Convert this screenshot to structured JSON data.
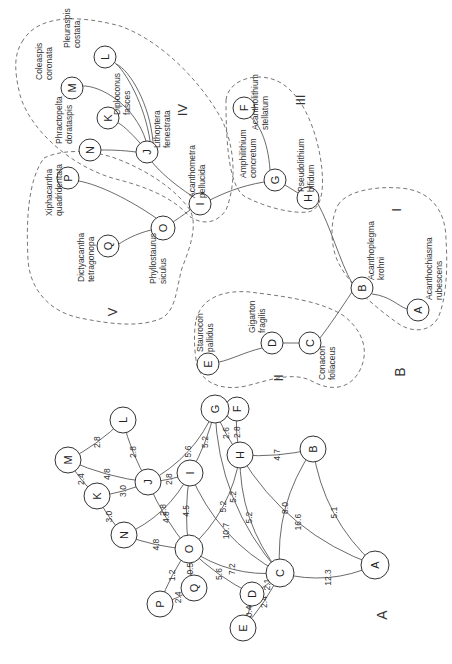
{
  "panels": {
    "a_label": "A",
    "b_label": "B"
  },
  "diagram_a": {
    "nodes": [
      {
        "id": "A",
        "x": 375,
        "y": 565,
        "r": 14
      },
      {
        "id": "B",
        "x": 313,
        "y": 449,
        "r": 13
      },
      {
        "id": "C",
        "x": 280,
        "y": 573,
        "r": 14
      },
      {
        "id": "D",
        "x": 252,
        "y": 594,
        "r": 12
      },
      {
        "id": "E",
        "x": 243,
        "y": 628,
        "r": 13
      },
      {
        "id": "F",
        "x": 237,
        "y": 409,
        "r": 12
      },
      {
        "id": "G",
        "x": 215,
        "y": 409,
        "r": 14
      },
      {
        "id": "H",
        "x": 240,
        "y": 455,
        "r": 13
      },
      {
        "id": "I",
        "x": 190,
        "y": 473,
        "r": 13
      },
      {
        "id": "J",
        "x": 148,
        "y": 482,
        "r": 13
      },
      {
        "id": "K",
        "x": 97,
        "y": 496,
        "r": 13
      },
      {
        "id": "L",
        "x": 123,
        "y": 420,
        "r": 13
      },
      {
        "id": "M",
        "x": 68,
        "y": 460,
        "r": 13
      },
      {
        "id": "N",
        "x": 124,
        "y": 535,
        "r": 13
      },
      {
        "id": "O",
        "x": 189,
        "y": 549,
        "r": 14
      },
      {
        "id": "P",
        "x": 160,
        "y": 604,
        "r": 13
      },
      {
        "id": "Q",
        "x": 194,
        "y": 588,
        "r": 13
      }
    ],
    "edges": [
      {
        "from": "M",
        "to": "L",
        "w": "2.8"
      },
      {
        "from": "L",
        "to": "J",
        "w": "2.8"
      },
      {
        "from": "M",
        "to": "J",
        "w": "4.8"
      },
      {
        "from": "M",
        "to": "K",
        "w": "2.4"
      },
      {
        "from": "K",
        "to": "J",
        "w": "3.0"
      },
      {
        "from": "K",
        "to": "N",
        "w": "3.0"
      },
      {
        "from": "J",
        "to": "G",
        "w": "5.6"
      },
      {
        "from": "J",
        "to": "I",
        "w": "2.8"
      },
      {
        "from": "I",
        "to": "G",
        "w": "5.2"
      },
      {
        "from": "N",
        "to": "I",
        "w": "2.8"
      },
      {
        "from": "J",
        "to": "O",
        "w": "4.8"
      },
      {
        "from": "N",
        "to": "O",
        "w": "4.8"
      },
      {
        "from": "I",
        "to": "O",
        "w": "4.5"
      },
      {
        "from": "I",
        "to": "C",
        "w": "10.7"
      },
      {
        "from": "O",
        "to": "H",
        "w": "5.2"
      },
      {
        "from": "O",
        "to": "C",
        "w": "7.2"
      },
      {
        "from": "G",
        "to": "C",
        "w": "5.2"
      },
      {
        "from": "G",
        "to": "H",
        "w": "2.6"
      },
      {
        "from": "F",
        "to": "H",
        "w": "2.8"
      },
      {
        "from": "G",
        "to": "F",
        "w": "0.4"
      },
      {
        "from": "H",
        "to": "C",
        "w": "5.2"
      },
      {
        "from": "H",
        "to": "B",
        "w": "4.7"
      },
      {
        "from": "H",
        "to": "A",
        "w": "16.6"
      },
      {
        "from": "B",
        "to": "A",
        "w": "5.1"
      },
      {
        "from": "B",
        "to": "C",
        "w": "8.0"
      },
      {
        "from": "C",
        "to": "A",
        "w": "12.3"
      },
      {
        "from": "O",
        "to": "D",
        "w": "5.6"
      },
      {
        "from": "O",
        "to": "Q",
        "w": "0.5"
      },
      {
        "from": "O",
        "to": "P",
        "w": "1.2"
      },
      {
        "from": "P",
        "to": "Q",
        "w": "2.4"
      },
      {
        "from": "D",
        "to": "C",
        "w": "2.1"
      },
      {
        "from": "E",
        "to": "D",
        "w": "0.4"
      },
      {
        "from": "E",
        "to": "C",
        "w": "2.4"
      }
    ]
  },
  "diagram_b": {
    "nodes": [
      {
        "id": "A",
        "x": 418,
        "y": 310,
        "r": 11,
        "name": "Acanthochiasma rubescens"
      },
      {
        "id": "B",
        "x": 362,
        "y": 288,
        "r": 11,
        "name": "Acanthoplegma krohni"
      },
      {
        "id": "C",
        "x": 310,
        "y": 343,
        "r": 11,
        "name": "Conacon foliaceus"
      },
      {
        "id": "D",
        "x": 272,
        "y": 343,
        "r": 11,
        "name": "Gigarton fragilis"
      },
      {
        "id": "E",
        "x": 208,
        "y": 364,
        "r": 11,
        "name": "Staurocon pallidus"
      },
      {
        "id": "F",
        "x": 244,
        "y": 108,
        "r": 11,
        "name": "Acantholithium stellatum"
      },
      {
        "id": "G",
        "x": 275,
        "y": 180,
        "r": 11,
        "name": "Amphilithium concretum"
      },
      {
        "id": "H",
        "x": 308,
        "y": 198,
        "r": 11,
        "name": "Pseudolithium bifidum"
      },
      {
        "id": "I",
        "x": 200,
        "y": 204,
        "r": 11,
        "name": "Acanthometra pellucida"
      },
      {
        "id": "J",
        "x": 147,
        "y": 152,
        "r": 11,
        "name": "Lithoptera fenestrata"
      },
      {
        "id": "K",
        "x": 108,
        "y": 118,
        "r": 11,
        "name": "Diploconus fasces"
      },
      {
        "id": "L",
        "x": 105,
        "y": 57,
        "r": 11,
        "name": "Pleuraspis costata"
      },
      {
        "id": "M",
        "x": 72,
        "y": 88,
        "r": 11,
        "name": "Coleaspis coronata"
      },
      {
        "id": "N",
        "x": 90,
        "y": 150,
        "r": 11,
        "name": "Phractopelta dorataspis"
      },
      {
        "id": "O",
        "x": 163,
        "y": 228,
        "r": 12,
        "name": "Phyllostaurus siculus"
      },
      {
        "id": "P",
        "x": 68,
        "y": 178,
        "r": 11,
        "name": "Xiphacantha quadridentata"
      },
      {
        "id": "Q",
        "x": 108,
        "y": 246,
        "r": 11,
        "name": "Dictyacantha tetragonopa"
      }
    ],
    "groups": [
      {
        "id": "I",
        "label": "I"
      },
      {
        "id": "II",
        "label": "II"
      },
      {
        "id": "III",
        "label": "III"
      },
      {
        "id": "IV",
        "label": "IV"
      },
      {
        "id": "V",
        "label": "V"
      }
    ]
  }
}
